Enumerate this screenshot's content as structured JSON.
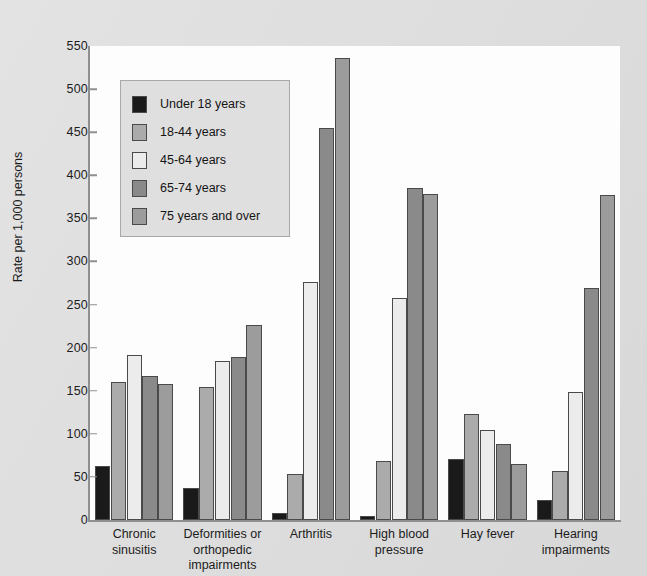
{
  "chart_data": {
    "type": "bar",
    "title": "",
    "subtitle": "",
    "xlabel": "",
    "ylabel": "Rate per 1,000 persons",
    "ylim": [
      0,
      550
    ],
    "ytick_step": 50,
    "yticks": [
      0,
      50,
      100,
      150,
      200,
      250,
      300,
      350,
      400,
      450,
      500,
      550
    ],
    "ytick_labels": [
      "0",
      "50",
      "100",
      "150",
      "200",
      "250",
      "300",
      "350",
      "400",
      "450",
      "500",
      "550"
    ],
    "grid": false,
    "legend_position": "upper-left-inside",
    "categories": [
      "Chronic\nsinusitis",
      "Deformities or\northopedic\nimpairments",
      "Arthritis",
      "High blood\npressure",
      "Hay fever",
      "Hearing\nimpairments"
    ],
    "category_lines": [
      [
        "Chronic",
        "sinusitis"
      ],
      [
        "Deformities or",
        "orthopedic",
        "impairments"
      ],
      [
        "Arthritis"
      ],
      [
        "High blood",
        "pressure"
      ],
      [
        "Hay fever"
      ],
      [
        "Hearing",
        "impairments"
      ]
    ],
    "series": [
      {
        "name": "Under 18 years",
        "color": "#1a1a1a",
        "values": [
          63,
          37,
          8,
          5,
          71,
          23
        ]
      },
      {
        "name": "18-44 years",
        "color": "#ababab",
        "values": [
          160,
          154,
          53,
          68,
          123,
          57
        ]
      },
      {
        "name": "45-64 years",
        "color": "#ececec",
        "values": [
          191,
          184,
          276,
          258,
          104,
          148
        ]
      },
      {
        "name": "65-74 years",
        "color": "#8a8a8a",
        "values": [
          167,
          189,
          455,
          385,
          88,
          269
        ]
      },
      {
        "name": "75 years and over",
        "color": "#9c9c9c",
        "values": [
          158,
          226,
          536,
          378,
          65,
          377
        ]
      }
    ]
  },
  "legend": {
    "entries": [
      {
        "label": "Under 18 years"
      },
      {
        "label": "18-44 years"
      },
      {
        "label": "45-64 years"
      },
      {
        "label": "65-74 years"
      },
      {
        "label": "75 years and over"
      }
    ]
  },
  "colors": {
    "background": "#dedede",
    "panel": "#fdfdfd",
    "axis": "#8f8f8f",
    "bar_outline": "#4a4a4a",
    "legend_fill": "#dfdfdf",
    "legend_border": "#a8a8a8",
    "text": "#1c1c1c"
  }
}
